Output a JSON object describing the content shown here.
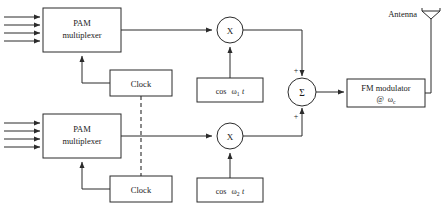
{
  "figure": {
    "background_color": "#ffffff",
    "line_color": "#2b2b2b"
  },
  "channels": {
    "upper": {
      "multiplexer": {
        "line1": "PAM",
        "line2": "multiplexer",
        "input_arrow_count": 4
      },
      "clock": {
        "label": "Clock"
      },
      "multiplier": {
        "glyph": "X",
        "name": "multiplier"
      },
      "oscillator": {
        "prefix": "cos",
        "omega": "ω",
        "subscript": "1",
        "time_var": "t"
      }
    },
    "lower": {
      "multiplexer": {
        "line1": "PAM",
        "line2": "multiplexer",
        "input_arrow_count": 4
      },
      "clock": {
        "label": "Clock"
      },
      "multiplier": {
        "glyph": "X",
        "name": "multiplier"
      },
      "oscillator": {
        "prefix": "cos",
        "omega": "ω",
        "subscript": "2",
        "time_var": "t"
      }
    }
  },
  "summer": {
    "glyph": "Σ",
    "top_sign": "+",
    "bottom_sign": "+"
  },
  "modulator": {
    "line1": "FM modulator",
    "at_symbol": "@",
    "omega": "ω",
    "subscript": "c"
  },
  "antenna": {
    "label": "Antenna"
  }
}
